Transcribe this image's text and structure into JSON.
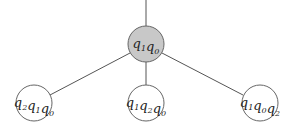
{
  "tree": {
    "root": {
      "label": "q1q0",
      "parts": [
        [
          "q",
          "1"
        ],
        [
          "q",
          "0"
        ]
      ],
      "fill": "#c8c8c8"
    },
    "children": [
      {
        "label": "q2q1q0",
        "parts": [
          [
            "q",
            "2"
          ],
          [
            "q",
            "1"
          ],
          [
            "q",
            "0"
          ]
        ]
      },
      {
        "label": "q1q2q0",
        "parts": [
          [
            "q",
            "1"
          ],
          [
            "q",
            "2"
          ],
          [
            "q",
            "0"
          ]
        ]
      },
      {
        "label": "q1q0q2",
        "parts": [
          [
            "q",
            "1"
          ],
          [
            "q",
            "0"
          ],
          [
            "q",
            "2"
          ]
        ]
      }
    ]
  }
}
